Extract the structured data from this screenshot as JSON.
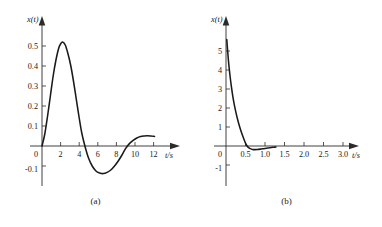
{
  "figure": {
    "panels": [
      {
        "id": "a",
        "caption": "(a)",
        "ylabel": "x(t)",
        "xlabel": "t/s"
      },
      {
        "id": "b",
        "caption": "(b)",
        "ylabel": "x(t)",
        "xlabel": "t/s"
      }
    ]
  },
  "chart_data": [
    {
      "type": "line",
      "id": "a",
      "title": "",
      "xlabel": "t/s",
      "ylabel": "x(t)",
      "xlim": [
        0,
        13
      ],
      "ylim": [
        -0.15,
        0.58
      ],
      "grid": false,
      "legend": null,
      "xticks": [
        2,
        4,
        6,
        8,
        10,
        12
      ],
      "xticklabels": [
        "2",
        "4",
        "6",
        "8",
        "10",
        "12"
      ],
      "yticks": [
        -0.1,
        0,
        0.1,
        0.2,
        0.3,
        0.4,
        0.5
      ],
      "yticklabels": [
        "-0.1",
        "0",
        "0.1",
        "0.2",
        "0.3",
        "0.4",
        "0.5"
      ],
      "description": "damped oscillation starting at origin, peak ~0.52 near t=2.2, zero crossing near t=4.7, trough ~-0.135 near t=6.6, zero crossing near t=9.0, small second peak ~0.05 near t=11.3",
      "series": [
        {
          "name": "x(t)",
          "x": [
            0,
            0.3,
            0.6,
            0.9,
            1.2,
            1.5,
            1.8,
            2.0,
            2.2,
            2.5,
            2.8,
            3.1,
            3.4,
            3.7,
            4.0,
            4.3,
            4.7,
            5.0,
            5.4,
            5.8,
            6.2,
            6.6,
            7.0,
            7.4,
            7.8,
            8.2,
            8.6,
            9.0,
            9.4,
            9.8,
            10.2,
            10.6,
            11.0,
            11.3,
            11.7,
            12.1
          ],
          "y": [
            0.0,
            0.06,
            0.15,
            0.25,
            0.35,
            0.43,
            0.49,
            0.51,
            0.52,
            0.505,
            0.46,
            0.4,
            0.32,
            0.23,
            0.14,
            0.06,
            -0.015,
            -0.06,
            -0.1,
            -0.125,
            -0.135,
            -0.138,
            -0.132,
            -0.12,
            -0.1,
            -0.075,
            -0.045,
            -0.012,
            0.012,
            0.028,
            0.04,
            0.047,
            0.05,
            0.051,
            0.05,
            0.048
          ]
        }
      ]
    },
    {
      "type": "line",
      "id": "b",
      "title": "",
      "xlabel": "t/s",
      "ylabel": "x(t)",
      "xlim": [
        0,
        3.4
      ],
      "ylim": [
        -1.3,
        5.8
      ],
      "grid": false,
      "legend": null,
      "xticks": [
        0.5,
        1.0,
        1.5,
        2.0,
        2.5,
        3.0
      ],
      "xticklabels": [
        "0.5",
        "1.0",
        "1.5",
        "2.0",
        "2.5",
        "3.0"
      ],
      "yticks": [
        -1,
        0,
        1,
        2,
        3,
        4,
        5
      ],
      "yticklabels": [
        "-1",
        "0",
        "1",
        "2",
        "3",
        "4",
        "5"
      ],
      "description": "steeply decaying curve starting near x=5.6 at t=0, falling rapidly, crossing zero near t=0.52, shallow minimum about -0.18 near t=0.8, rising back toward zero and ending near t=1.3",
      "series": [
        {
          "name": "x(t)",
          "x": [
            0.02,
            0.06,
            0.1,
            0.14,
            0.18,
            0.22,
            0.26,
            0.3,
            0.34,
            0.38,
            0.42,
            0.46,
            0.5,
            0.54,
            0.58,
            0.62,
            0.68,
            0.74,
            0.8,
            0.88,
            0.96,
            1.04,
            1.12,
            1.2,
            1.28
          ],
          "y": [
            5.6,
            4.55,
            3.75,
            3.1,
            2.55,
            2.1,
            1.72,
            1.38,
            1.08,
            0.82,
            0.58,
            0.36,
            0.15,
            0.0,
            -0.09,
            -0.14,
            -0.18,
            -0.19,
            -0.185,
            -0.165,
            -0.14,
            -0.115,
            -0.09,
            -0.07,
            -0.055
          ]
        }
      ]
    }
  ]
}
